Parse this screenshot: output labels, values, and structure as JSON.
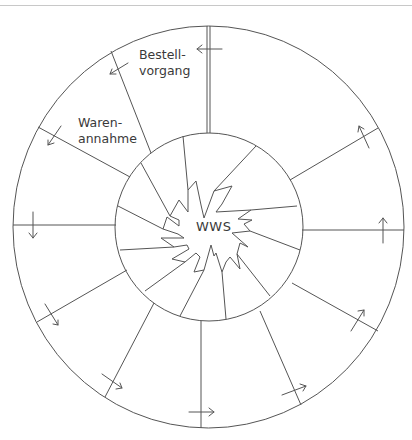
{
  "diagram": {
    "center_label": "WWS",
    "segments": [
      {
        "label_line1": "Bestell-",
        "label_line2": "vorgang"
      },
      {
        "label_line1": "Waren-",
        "label_line2": "annahme"
      }
    ]
  }
}
